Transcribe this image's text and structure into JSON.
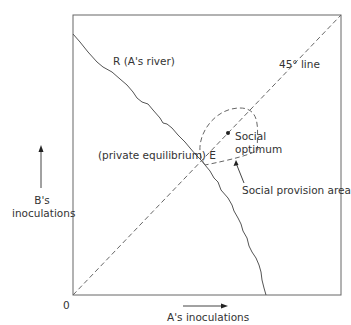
{
  "diagram": {
    "type": "economics-reaction-diagram",
    "origin_label": "0",
    "x_axis": {
      "label": "A's inoculations",
      "arrow": "right"
    },
    "y_axis": {
      "label_line1": "B's",
      "label_line2": "inoculations",
      "arrow": "up"
    },
    "curves": {
      "reaction_curve_label": "R (A's river)",
      "forty_five_line_label": "45° line"
    },
    "points": {
      "private_equilibrium_label": "(private equilibrium) E",
      "social_optimum_line1": "Social",
      "social_optimum_line2": "optimum"
    },
    "regions": {
      "social_provision_area_label": "Social provision area"
    },
    "colors": {
      "line": "#555555",
      "text": "#333333",
      "background": "#ffffff"
    }
  }
}
